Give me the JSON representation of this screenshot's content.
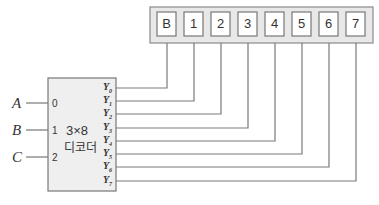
{
  "diagram": {
    "type": "decoder-to-seven-segment-display",
    "decoder": {
      "title_line1": "3×8",
      "title_line2": "디코더",
      "inputs": [
        {
          "signal": "A",
          "pin": "0"
        },
        {
          "signal": "B",
          "pin": "1"
        },
        {
          "signal": "C",
          "pin": "2"
        }
      ],
      "outputs": [
        "Y0",
        "Y1",
        "Y2",
        "Y3",
        "Y4",
        "Y5",
        "Y6",
        "Y7"
      ],
      "output_labels": [
        {
          "base": "Y",
          "sub": "0"
        },
        {
          "base": "Y",
          "sub": "1"
        },
        {
          "base": "Y",
          "sub": "2"
        },
        {
          "base": "Y",
          "sub": "3"
        },
        {
          "base": "Y",
          "sub": "4"
        },
        {
          "base": "Y",
          "sub": "5"
        },
        {
          "base": "Y",
          "sub": "6"
        },
        {
          "base": "Y",
          "sub": "7"
        }
      ]
    },
    "display_cells": [
      "B",
      "1",
      "2",
      "3",
      "4",
      "5",
      "6",
      "7"
    ],
    "connections": [
      {
        "from": "Y0",
        "to": "B"
      },
      {
        "from": "Y1",
        "to": "1"
      },
      {
        "from": "Y2",
        "to": "2"
      },
      {
        "from": "Y3",
        "to": "3"
      },
      {
        "from": "Y4",
        "to": "4"
      },
      {
        "from": "Y5",
        "to": "5"
      },
      {
        "from": "Y6",
        "to": "6"
      },
      {
        "from": "Y7",
        "to": "7"
      }
    ],
    "colors": {
      "line": "#7a7a7a",
      "box_fill": "#eeeeee",
      "panel_fill": "#e6e6e6",
      "cell_fill": "#ffffff",
      "text": "#333333"
    }
  }
}
